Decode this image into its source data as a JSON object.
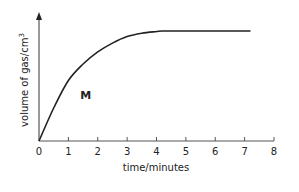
{
  "chart_data": {
    "type": "line",
    "title": "",
    "xlabel": "time/minutes",
    "ylabel": "volume of gas/cm",
    "ylabel_superscript": "3",
    "xlim": [
      0,
      8
    ],
    "ylim": [
      0,
      1.15
    ],
    "x_ticks": [
      0,
      1,
      2,
      3,
      4,
      5,
      6,
      7,
      8
    ],
    "x_tick_labels": [
      "0",
      "1",
      "2",
      "3",
      "4",
      "5",
      "6",
      "7",
      "8"
    ],
    "y_ticks": [],
    "y_axis_units": "relative (no numeric scale shown; plateau = 1.0)",
    "grid": false,
    "legend": "none",
    "series": [
      {
        "name": "M",
        "color": "#222222",
        "x": [
          0,
          0.5,
          1,
          1.5,
          2,
          2.5,
          3,
          3.5,
          4,
          4.2,
          5,
          6,
          7,
          7.2
        ],
        "y": [
          0,
          0.3,
          0.55,
          0.7,
          0.81,
          0.89,
          0.95,
          0.98,
          0.995,
          1.0,
          1.0,
          1.0,
          1.0,
          1.0
        ]
      }
    ],
    "annotations": [
      {
        "text": "M",
        "x": 1.2,
        "y": 0.52
      }
    ]
  }
}
